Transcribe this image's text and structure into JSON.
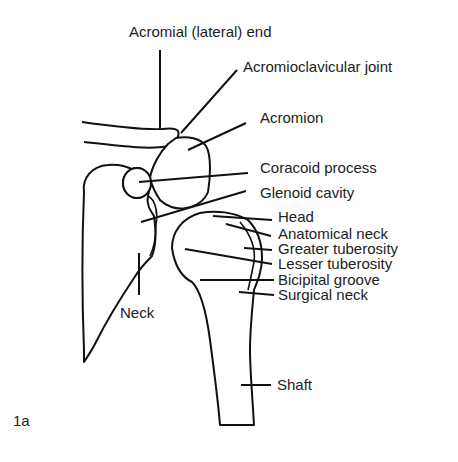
{
  "figure": {
    "label": "1a"
  },
  "labels": {
    "acromial_end": "Acromial (lateral) end",
    "acromioclavicular_joint": "Acromioclavicular joint",
    "acromion": "Acromion",
    "coracoid_process": "Coracoid process",
    "glenoid_cavity": "Glenoid cavity",
    "head": "Head",
    "anatomical_neck": "Anatomical neck",
    "greater_tuberosity": "Greater tuberosity",
    "lesser_tuberosity": "Lesser tuberosity",
    "bicipital_groove": "Bicipital groove",
    "surgical_neck": "Surgical neck",
    "neck": "Neck",
    "shaft": "Shaft"
  },
  "colors": {
    "line": "#111111",
    "text": "#222222",
    "shading": "#d9d9d9",
    "background": "#ffffff"
  }
}
